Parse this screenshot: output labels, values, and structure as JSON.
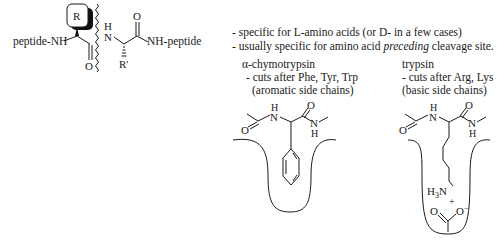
{
  "peptide": {
    "left_label": "peptide-NH",
    "right_label": "NH-peptide",
    "r_group": "R",
    "r_prime": "R'",
    "carbonyl_o": "O",
    "amide_h": "H",
    "amide_n": "N",
    "right_o": "O"
  },
  "notes": {
    "line1_prefix": "- specific for ",
    "line1_L": "L",
    "line1_mid": "-amino acids (or ",
    "line1_D": "D",
    "line1_suffix": "- in a few cases)",
    "line2_prefix": "- usually specific for amino acid ",
    "line2_em": "preceding",
    "line2_suffix": " cleavage site."
  },
  "enzymes": [
    {
      "name": "α-chymotrypsin",
      "rule": "- cuts after Phe, Tyr, Trp",
      "detail": "(aromatic side chains)",
      "pocket_labels": {
        "h_top": "H",
        "n": "N",
        "o_top": "O",
        "o_left": "O",
        "n_right": "N",
        "h_bottom": "H"
      }
    },
    {
      "name": "trypsin",
      "rule": "- cuts after Arg, Lys",
      "detail": "(basic side chains)",
      "pocket_labels": {
        "h_top": "H",
        "n": "N",
        "o_top": "O",
        "o_left": "O",
        "n_right": "N",
        "h_bottom": "H",
        "ammonium": "H3N",
        "plus": "+",
        "carboxylate_o": "O",
        "carboxylate_om": "O−"
      }
    }
  ]
}
